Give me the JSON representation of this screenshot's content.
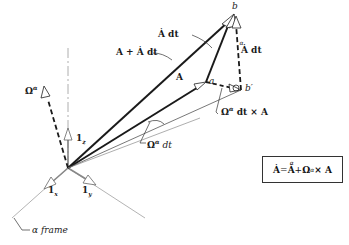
{
  "diagram": {
    "points": {
      "a": "a",
      "b": "b",
      "b_prime": "b′"
    },
    "labels": {
      "A": "A",
      "A_plus_Adot_dt": "A + Ȧ dt",
      "Adot_dt": "Ȧ dt",
      "Adot_alpha_dt": "Ȧ dt",
      "Adot_alpha_dt_sup": "α",
      "Omega_alpha_dt_cross_A": "Ω",
      "Omega_alpha_dt_cross_A_sup": "α",
      "Omega_alpha_dt_cross_A_rest": " dt × A",
      "Omega_alpha_dt": "Ω",
      "Omega_alpha_dt_sup": "α",
      "Omega_alpha_dt_rest": " dt",
      "Omega_alpha": "Ω",
      "Omega_alpha_sup": "α",
      "unit_z": "1",
      "unit_z_sub": "z",
      "unit_x": "1",
      "unit_x_sub": "x",
      "unit_y": "1",
      "unit_y_sub": "y",
      "frame": "α frame"
    },
    "equation": {
      "lhs": "Ȧ",
      "eq": " = ",
      "rhs1": "Ȧ",
      "rhs1_sup": "α",
      "plus": " + ",
      "omega": "Ω",
      "omega_sup": "α",
      "cross": " × A"
    },
    "colors": {
      "ink": "#1a1a1a",
      "axis": "#9a9a9a",
      "thin": "#555555"
    }
  }
}
